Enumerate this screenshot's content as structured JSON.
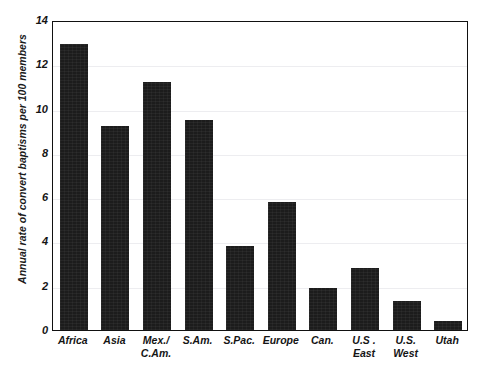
{
  "chart_data": {
    "type": "bar",
    "title": "",
    "xlabel": "",
    "ylabel": "Annual rate of convert baptisms per 100 members",
    "ylim": [
      0,
      14
    ],
    "ytick_labels": [
      "0",
      "2",
      "4",
      "6",
      "8",
      "10",
      "12",
      "14"
    ],
    "ytick_values": [
      0,
      2,
      4,
      6,
      8,
      10,
      12,
      14
    ],
    "grid": true,
    "legend": false,
    "bar_color": "#1c1c1c",
    "categories": [
      "Africa",
      "Asia",
      "Mex./\nC.Am.",
      "S.Am.",
      "S.Pac.",
      "Europe",
      "Can.",
      "U.S .\nEast",
      "U.S.\nWest",
      "Utah"
    ],
    "values": [
      12.9,
      9.2,
      11.2,
      9.5,
      3.8,
      5.8,
      1.9,
      2.8,
      1.3,
      0.4
    ]
  },
  "axes": {
    "frame_color": "#111111",
    "gridline_color": "#ededf0"
  }
}
